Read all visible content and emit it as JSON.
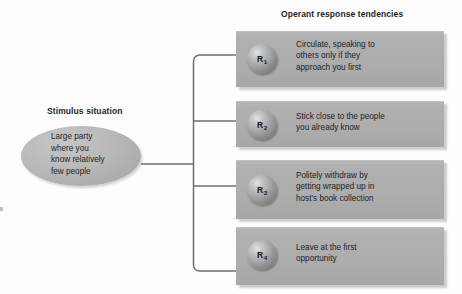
{
  "figure": {
    "type": "flow-diagram",
    "headings": {
      "operant": "Operant response tendencies",
      "stimulus": "Stimulus situation"
    },
    "stimulus": {
      "shape": "ellipse",
      "lines": [
        "Large party",
        "where you",
        "know relatively",
        "few people"
      ]
    },
    "responses": [
      {
        "id": "R",
        "subscript": "1",
        "lines": [
          "Circulate, speaking to",
          "others only if they",
          "approach you first"
        ]
      },
      {
        "id": "R",
        "subscript": "2",
        "lines": [
          "Stick close to the people",
          "you already know"
        ]
      },
      {
        "id": "R",
        "subscript": "3",
        "lines": [
          "Politely withdraw by",
          "getting wrapped up in",
          "host's book collection"
        ]
      },
      {
        "id": "R",
        "subscript": "4",
        "lines": [
          "Leave at the first",
          "opportunity"
        ]
      }
    ],
    "colors": {
      "background": "#fdfdfd",
      "box_fill": "#adadad",
      "ellipse_fill": "#b9b9b9",
      "sphere_highlight": "#e3e3e3",
      "sphere_shadow": "#5e5e5e",
      "text": "#232327",
      "heading_text": "#1d1d1f",
      "connector_line": "#6e6e6e"
    }
  }
}
